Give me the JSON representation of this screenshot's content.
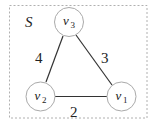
{
  "diagram": {
    "set_label": "S",
    "colors": {
      "edge": "#333333",
      "node_stroke": "#aaaaaa",
      "border": "#b0b0b0",
      "text": "#222222"
    },
    "nodes": [
      {
        "id": "v3",
        "base": "v",
        "sub": "3",
        "cx": 69,
        "cy": 22
      },
      {
        "id": "v2",
        "base": "v",
        "sub": "2",
        "cx": 40.5,
        "cy": 96.5
      },
      {
        "id": "v1",
        "base": "v",
        "sub": "1",
        "cx": 121.5,
        "cy": 96.5
      }
    ],
    "edges": [
      {
        "from": "v3",
        "to": "v2",
        "weight": "4"
      },
      {
        "from": "v3",
        "to": "v1",
        "weight": "3"
      },
      {
        "from": "v2",
        "to": "v1",
        "weight": "2"
      }
    ]
  }
}
